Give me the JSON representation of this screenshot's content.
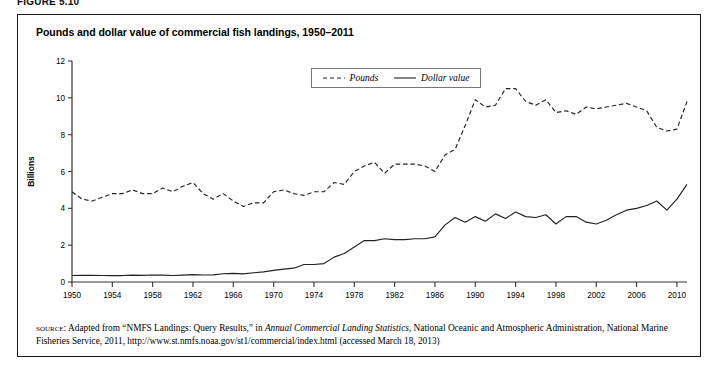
{
  "figure_label": "FIGURE 5.10",
  "chart_title": "Pounds and dollar value of commercial fish landings, 1950–2011",
  "legend": {
    "items": [
      {
        "label": "Pounds",
        "style": "dashed"
      },
      {
        "label": "Dollar value",
        "style": "solid"
      }
    ]
  },
  "source_note": {
    "kicker": "source:",
    "part1": " Adapted from “NMFS Landings: Query Results,” in ",
    "italic": "Annual Commercial Landing Statistics",
    "part2": ", National Oceanic and Atmospheric Administration, National Marine Fisheries Service, 2011, http://www.st.nmfs.noaa.gov/st1/commercial/index.html (accessed March 18, 2013)"
  },
  "chart_data": {
    "type": "line",
    "title": "Pounds and dollar value of commercial fish landings, 1950–2011",
    "xlabel": "",
    "ylabel": "Billions",
    "xlim": [
      1950,
      2011
    ],
    "ylim": [
      0,
      12
    ],
    "yticks": [
      0,
      2,
      4,
      6,
      8,
      10,
      12
    ],
    "xticks": [
      1950,
      1954,
      1958,
      1962,
      1966,
      1970,
      1974,
      1978,
      1982,
      1986,
      1990,
      1994,
      1998,
      2002,
      2006,
      2010
    ],
    "grid": false,
    "legend_position": "top-center",
    "x": [
      1950,
      1951,
      1952,
      1953,
      1954,
      1955,
      1956,
      1957,
      1958,
      1959,
      1960,
      1961,
      1962,
      1963,
      1964,
      1965,
      1966,
      1967,
      1968,
      1969,
      1970,
      1971,
      1972,
      1973,
      1974,
      1975,
      1976,
      1977,
      1978,
      1979,
      1980,
      1981,
      1982,
      1983,
      1984,
      1985,
      1986,
      1987,
      1988,
      1989,
      1990,
      1991,
      1992,
      1993,
      1994,
      1995,
      1996,
      1997,
      1998,
      1999,
      2000,
      2001,
      2002,
      2003,
      2004,
      2005,
      2006,
      2007,
      2008,
      2009,
      2010,
      2011
    ],
    "series": [
      {
        "name": "Pounds",
        "style": "dashed",
        "color": "#222222",
        "values": [
          4.9,
          4.5,
          4.4,
          4.6,
          4.8,
          4.8,
          5.0,
          4.8,
          4.8,
          5.1,
          4.9,
          5.2,
          5.4,
          4.8,
          4.5,
          4.8,
          4.4,
          4.1,
          4.3,
          4.3,
          4.9,
          5.0,
          4.8,
          4.7,
          4.9,
          4.9,
          5.4,
          5.3,
          6.0,
          6.3,
          6.5,
          5.9,
          6.4,
          6.4,
          6.4,
          6.3,
          6.0,
          6.9,
          7.2,
          8.5,
          9.9,
          9.5,
          9.6,
          10.5,
          10.5,
          9.8,
          9.6,
          9.9,
          9.2,
          9.3,
          9.1,
          9.5,
          9.4,
          9.5,
          9.6,
          9.7,
          9.5,
          9.3,
          8.4,
          8.2,
          8.3,
          9.8
        ]
      },
      {
        "name": "Dollar value",
        "style": "solid",
        "color": "#222222",
        "values": [
          0.35,
          0.36,
          0.36,
          0.35,
          0.35,
          0.35,
          0.37,
          0.36,
          0.38,
          0.37,
          0.35,
          0.37,
          0.4,
          0.38,
          0.39,
          0.45,
          0.47,
          0.44,
          0.5,
          0.55,
          0.63,
          0.7,
          0.75,
          0.95,
          0.95,
          1.0,
          1.35,
          1.55,
          1.9,
          2.25,
          2.25,
          2.35,
          2.3,
          2.3,
          2.35,
          2.35,
          2.45,
          3.1,
          3.5,
          3.25,
          3.55,
          3.3,
          3.7,
          3.45,
          3.8,
          3.55,
          3.5,
          3.65,
          3.15,
          3.55,
          3.55,
          3.25,
          3.15,
          3.35,
          3.65,
          3.9,
          4.0,
          4.15,
          4.4,
          3.9,
          4.5,
          5.3
        ]
      }
    ]
  }
}
